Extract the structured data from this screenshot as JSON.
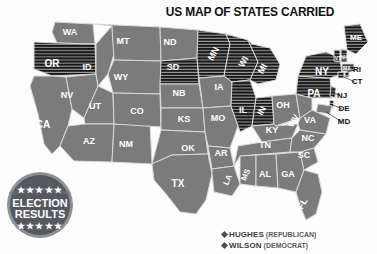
{
  "title": "US MAP OF STATES CARRIED",
  "colors": {
    "wilson_fill": "#7b7b7b",
    "hughes_fill": "#171717",
    "hughes_stripe": "#9a9a9a",
    "border": "#d9d9d9",
    "background": "#fdfdfd",
    "badge": "#55585f",
    "badge_ring": "#8d9097",
    "legend_text": "#3d3d3d"
  },
  "badge": {
    "line1": "ELECTION",
    "line2": "RESULTS",
    "stars_top": "★★★★★",
    "stars_bottom": "★★★★★"
  },
  "legend": {
    "position": "bottom-right",
    "entries": [
      {
        "marker": "diamond-marker",
        "name": "HUGHES",
        "party": "(REPUBLICAN)",
        "fill": "hughes"
      },
      {
        "marker": "diamond-marker",
        "name": "WILSON",
        "party": "(DEMOCRAT)",
        "fill": "wilson"
      }
    ]
  },
  "chart_data": {
    "type": "map",
    "title": "US MAP OF STATES CARRIED",
    "legend": [
      "HUGHES (REPUBLICAN)",
      "WILSON (DEMOCRAT)"
    ],
    "categories": [
      "hughes",
      "wilson"
    ],
    "encoding": {
      "hughes": "black-horizontal-hatch",
      "wilson": "solid-gray"
    },
    "counts": {
      "hughes": 18,
      "wilson": 30
    },
    "states": [
      {
        "id": "WA",
        "label": "WA",
        "winner": "wilson",
        "lx": 70,
        "ly": 19,
        "fs": 9
      },
      {
        "id": "OR",
        "label": "OR",
        "winner": "hughes",
        "lx": 52,
        "ly": 50,
        "fs": 10
      },
      {
        "id": "CA",
        "label": "CA",
        "winner": "wilson",
        "lx": 43,
        "ly": 111,
        "fs": 10
      },
      {
        "id": "NV",
        "label": "NV",
        "winner": "wilson",
        "lx": 67,
        "ly": 82,
        "fs": 9
      },
      {
        "id": "ID",
        "label": "ID",
        "winner": "wilson",
        "lx": 87,
        "ly": 54,
        "fs": 9
      },
      {
        "id": "MT",
        "label": "MT",
        "winner": "wilson",
        "lx": 123,
        "ly": 28,
        "fs": 9
      },
      {
        "id": "WY",
        "label": "WY",
        "winner": "wilson",
        "lx": 121,
        "ly": 64,
        "fs": 9
      },
      {
        "id": "UT",
        "label": "UT",
        "winner": "wilson",
        "lx": 95,
        "ly": 93,
        "fs": 9
      },
      {
        "id": "AZ",
        "label": "AZ",
        "winner": "wilson",
        "lx": 89,
        "ly": 128,
        "fs": 9
      },
      {
        "id": "NM",
        "label": "NM",
        "winner": "wilson",
        "lx": 126,
        "ly": 131,
        "fs": 9
      },
      {
        "id": "CO",
        "label": "CO",
        "winner": "wilson",
        "lx": 137,
        "ly": 98,
        "fs": 9
      },
      {
        "id": "ND",
        "label": "ND",
        "winner": "wilson",
        "lx": 170,
        "ly": 29,
        "fs": 9
      },
      {
        "id": "SD",
        "label": "SD",
        "winner": "hughes",
        "lx": 173,
        "ly": 54,
        "fs": 9
      },
      {
        "id": "NB",
        "label": "NB",
        "winner": "wilson",
        "lx": 179,
        "ly": 80,
        "fs": 9
      },
      {
        "id": "KS",
        "label": "KS",
        "winner": "wilson",
        "lx": 184,
        "ly": 106,
        "fs": 9
      },
      {
        "id": "OK",
        "label": "OK",
        "winner": "wilson",
        "lx": 188,
        "ly": 135,
        "fs": 9
      },
      {
        "id": "TX",
        "label": "TX",
        "winner": "wilson",
        "lx": 178,
        "ly": 170,
        "fs": 10
      },
      {
        "id": "MN",
        "label": "MN",
        "winner": "hughes",
        "lx": 214,
        "ly": 40,
        "fs": 9,
        "rot": -62
      },
      {
        "id": "IA",
        "label": "IA",
        "winner": "wilson",
        "lx": 219,
        "ly": 74,
        "fs": 9
      },
      {
        "id": "MO",
        "label": "MO",
        "winner": "wilson",
        "lx": 218,
        "ly": 105,
        "fs": 9
      },
      {
        "id": "AR",
        "label": "AR",
        "winner": "wilson",
        "lx": 221,
        "ly": 140,
        "fs": 9
      },
      {
        "id": "LA",
        "label": "LA",
        "winner": "wilson",
        "lx": 228,
        "ly": 166,
        "fs": 8,
        "rot": -66
      },
      {
        "id": "WI",
        "label": "WI",
        "winner": "hughes",
        "lx": 244,
        "ly": 48,
        "fs": 9,
        "rot": -62
      },
      {
        "id": "IL",
        "label": "IL",
        "winner": "hughes",
        "lx": 243,
        "ly": 97,
        "fs": 9
      },
      {
        "id": "MI",
        "label": "MI",
        "winner": "hughes",
        "lx": 263,
        "ly": 55,
        "fs": 9,
        "rot": -62
      },
      {
        "id": "IN",
        "label": "IN",
        "winner": "hughes",
        "lx": 262,
        "ly": 97,
        "fs": 9,
        "rot": -62
      },
      {
        "id": "OH",
        "label": "OH",
        "winner": "wilson",
        "lx": 283,
        "ly": 92,
        "fs": 9
      },
      {
        "id": "KY",
        "label": "KY",
        "winner": "wilson",
        "lx": 272,
        "ly": 117,
        "fs": 9
      },
      {
        "id": "TN",
        "label": "TN",
        "winner": "wilson",
        "lx": 265,
        "ly": 132,
        "fs": 9
      },
      {
        "id": "MS",
        "label": "MS",
        "winner": "wilson",
        "lx": 246,
        "ly": 161,
        "fs": 8,
        "rot": -66
      },
      {
        "id": "AL",
        "label": "AL",
        "winner": "wilson",
        "lx": 265,
        "ly": 161,
        "fs": 9
      },
      {
        "id": "GA",
        "label": "GA",
        "winner": "wilson",
        "lx": 288,
        "ly": 161,
        "fs": 9
      },
      {
        "id": "FL",
        "label": "FL",
        "winner": "wilson",
        "lx": 303,
        "ly": 190,
        "fs": 9,
        "rot": -60
      },
      {
        "id": "SC",
        "label": "SC",
        "winner": "wilson",
        "lx": 304,
        "ly": 142,
        "fs": 9
      },
      {
        "id": "NC",
        "label": "NC",
        "winner": "wilson",
        "lx": 308,
        "ly": 125,
        "fs": 9
      },
      {
        "id": "VA",
        "label": "VA",
        "winner": "wilson",
        "lx": 310,
        "ly": 107,
        "fs": 9
      },
      {
        "id": "WV",
        "label": "WV",
        "winner": "wilson",
        "lx": 294,
        "ly": 107,
        "fs": 8,
        "rot": -62
      },
      {
        "id": "PA",
        "label": "PA",
        "winner": "hughes",
        "lx": 314,
        "ly": 80,
        "fs": 10
      },
      {
        "id": "NY",
        "label": "NY",
        "winner": "hughes",
        "lx": 322,
        "ly": 58,
        "fs": 10
      },
      {
        "id": "VT",
        "label": "VT",
        "winner": "hughes",
        "lx": 338,
        "ly": 45,
        "fs": 5
      },
      {
        "id": "NH",
        "label": "NH",
        "winner": "hughes",
        "lx": 344,
        "ly": 44,
        "fs": 5
      },
      {
        "id": "ME",
        "label": "ME",
        "winner": "hughes",
        "lx": 356,
        "ly": 24,
        "fs": 8
      },
      {
        "id": "MA",
        "label": "MA",
        "winner": "hughes",
        "lx": 347,
        "ly": 55,
        "fs": 5
      },
      {
        "id": "RI",
        "label": "RI",
        "winner": "hughes",
        "lx": 0,
        "ly": 0,
        "fs": 8,
        "external": true,
        "tx": 357,
        "ty": 56,
        "leader": [
          347,
          58,
          355,
          56
        ]
      },
      {
        "id": "CT",
        "label": "CT",
        "winner": "hughes",
        "lx": 0,
        "ly": 0,
        "fs": 8,
        "external": true,
        "tx": 357,
        "ty": 68,
        "leader": [
          344,
          63,
          355,
          68
        ]
      },
      {
        "id": "NJ",
        "label": "NJ",
        "winner": "hughes",
        "lx": 0,
        "ly": 0,
        "fs": 8,
        "external": true,
        "tx": 342,
        "ty": 82,
        "leader": [
          332,
          78,
          340,
          82
        ]
      },
      {
        "id": "DE",
        "label": "DE",
        "winner": "hughes",
        "lx": 0,
        "ly": 0,
        "fs": 8,
        "external": true,
        "tx": 344,
        "ty": 95,
        "leader": [
          331,
          90,
          342,
          95
        ]
      },
      {
        "id": "MD",
        "label": "MD",
        "winner": "wilson",
        "lx": 0,
        "ly": 0,
        "fs": 8,
        "external": true,
        "tx": 344,
        "ty": 108,
        "leader": [
          326,
          98,
          342,
          108
        ]
      }
    ]
  }
}
